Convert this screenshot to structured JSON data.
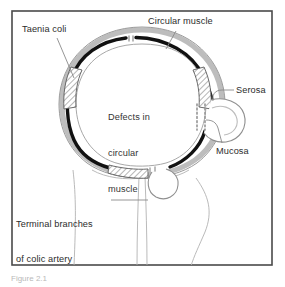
{
  "figure": {
    "caption": "Figure 2.1",
    "frame_color": "#4a4a4a",
    "background": "#ffffff"
  },
  "labels": {
    "taenia_coli": "Taenia coli",
    "circular_muscle": "Circular muscle",
    "serosa": "Serosa",
    "mucosa": "Mucosa",
    "terminal_branches_line1": "Terminal branches",
    "terminal_branches_line2": "of colic artery",
    "defects_line1": "Defects in",
    "defects_line2": "circular",
    "defects_line3": "muscle"
  },
  "colors": {
    "muscle_layer": "#111111",
    "serosa_layer": "#b5b5b5",
    "mucosa_layer": "#d8d8d8",
    "outline": "#8c8c8c",
    "hatch": "#555555",
    "leader": "#7d7d7d",
    "text": "#2c2c2c",
    "vessel": "#b0b0b0"
  },
  "anatomy": {
    "structures": [
      "colon lumen",
      "circular muscle layer",
      "taenia coli (three bands)",
      "serosa",
      "mucosa",
      "diverticulum",
      "terminal branches of colic artery",
      "mesentery"
    ],
    "taenia_count": 3,
    "diverticula_count": 2,
    "defect_markers": "dotted columns at muscle defects"
  }
}
